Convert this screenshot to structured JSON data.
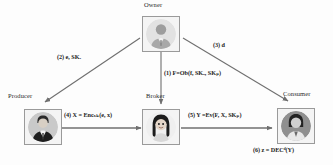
{
  "diagram": {
    "background": "#fdfdfd",
    "nodes": [
      {
        "id": "owner",
        "label": "Owner",
        "avatar": "businessman-avatar-icon"
      },
      {
        "id": "producer",
        "label": "Producer",
        "avatar": "businessman-avatar-icon"
      },
      {
        "id": "broker",
        "label": "Broker",
        "avatar": "businesswoman-avatar-icon"
      },
      {
        "id": "consumer",
        "label": "Consumer",
        "avatar": "person-avatar-icon"
      }
    ],
    "edges": [
      {
        "id": "edge-1",
        "from": "owner",
        "to": "broker",
        "step": "(1)",
        "text": "F=Ob(f, SK",
        "sub1": "o",
        "text2": ", SK",
        "sub2": "p",
        "text3": ")"
      },
      {
        "id": "edge-2",
        "from": "owner",
        "to": "producer",
        "step": "(2)",
        "text": "e, SK",
        "sub1": "e",
        "text2": "",
        "sub2": "",
        "text3": ""
      },
      {
        "id": "edge-3",
        "from": "owner",
        "to": "consumer",
        "step": "(3)",
        "text": "d",
        "sub1": "",
        "text2": "",
        "sub2": "",
        "text3": ""
      },
      {
        "id": "edge-4",
        "from": "producer",
        "to": "broker",
        "step": "(4)",
        "text": "X = Enc",
        "sub1": "sk",
        "text2": "(e, x)",
        "sub2": "",
        "text3": ""
      },
      {
        "id": "edge-5",
        "from": "broker",
        "to": "consumer",
        "step": "(5)",
        "text": "Y =Ev(F, X, SK",
        "sub1": "p",
        "text2": ")",
        "sub2": "",
        "text3": ""
      },
      {
        "id": "edge-6",
        "from": "consumer",
        "to": "consumer",
        "step": "(6)",
        "text": "z = DEC",
        "sub1": "d",
        "text2": "(Y)",
        "sub2": "",
        "text3": ""
      }
    ],
    "edge_label_text": {
      "label1": "(1) F=Ob(f, SKₒ, SKₚ)",
      "label2": "(2) e, SKₑ",
      "label3": "(3) d",
      "label4": "(4) X = Encₛₖ(e, x)",
      "label5": "(5) Y =Ev(F, X, SKₚ)",
      "label6": "(6) z = DECᵈ(Y)"
    },
    "colors": {
      "line": "#6f6f6f",
      "node_border": "#9a9a9a",
      "node_fill": "#f4f4f4",
      "text": "#1c1c1c"
    }
  }
}
